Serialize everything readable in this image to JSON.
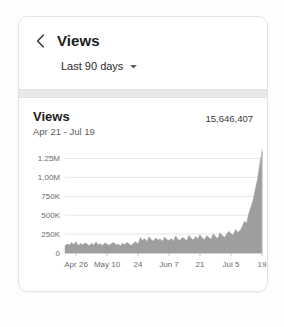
{
  "header": {
    "back_icon": "chevron-left-icon",
    "title": "Views",
    "range_label": "Last 90 days",
    "range_caret_icon": "chevron-down-icon"
  },
  "chart_card": {
    "title": "Views",
    "subtitle": "Apr 21 - Jul 19",
    "total": "15,646,407"
  },
  "colors": {
    "area_fill": "#9e9e9e",
    "gridline": "#e6e6e6",
    "axis_text": "#6b6b6b",
    "title_text": "#1d1d1d",
    "card_border": "#e4e4e4",
    "divider": "#e9e9e9"
  },
  "chart_data": {
    "type": "area",
    "title": "Views",
    "subtitle": "Apr 21 - Jul 19",
    "total": "15,646,407",
    "xlabel": "",
    "ylabel": "",
    "grid": true,
    "legend": "none",
    "ylim": [
      0,
      1375000
    ],
    "ytick_labels": [
      "1.25M",
      "1,00M",
      "750K",
      "500K",
      "250K",
      "0"
    ],
    "ytick_values": [
      1250000,
      1000000,
      750000,
      500000,
      250000,
      0
    ],
    "xtick_labels": [
      "Apr 26",
      "May 10",
      "24",
      "Jun 7",
      "21",
      "Jul 5",
      "19"
    ],
    "xtick_indices": [
      5,
      19,
      33,
      47,
      61,
      75,
      89
    ],
    "x_start": "Apr 21",
    "x_end": "Jul 19",
    "x": [
      "Apr 21",
      "Apr 22",
      "Apr 23",
      "Apr 24",
      "Apr 25",
      "Apr 26",
      "Apr 27",
      "Apr 28",
      "Apr 29",
      "Apr 30",
      "May 1",
      "May 2",
      "May 3",
      "May 4",
      "May 5",
      "May 6",
      "May 7",
      "May 8",
      "May 9",
      "May 10",
      "May 11",
      "May 12",
      "May 13",
      "May 14",
      "May 15",
      "May 16",
      "May 17",
      "May 18",
      "May 19",
      "May 20",
      "May 21",
      "May 22",
      "May 23",
      "May 24",
      "May 25",
      "May 26",
      "May 27",
      "May 28",
      "May 29",
      "May 30",
      "May 31",
      "Jun 1",
      "Jun 2",
      "Jun 3",
      "Jun 4",
      "Jun 5",
      "Jun 6",
      "Jun 7",
      "Jun 8",
      "Jun 9",
      "Jun 10",
      "Jun 11",
      "Jun 12",
      "Jun 13",
      "Jun 14",
      "Jun 15",
      "Jun 16",
      "Jun 17",
      "Jun 18",
      "Jun 19",
      "Jun 20",
      "Jun 21",
      "Jun 22",
      "Jun 23",
      "Jun 24",
      "Jun 25",
      "Jun 26",
      "Jun 27",
      "Jun 28",
      "Jun 29",
      "Jun 30",
      "Jul 1",
      "Jul 2",
      "Jul 3",
      "Jul 4",
      "Jul 5",
      "Jul 6",
      "Jul 7",
      "Jul 8",
      "Jul 9",
      "Jul 10",
      "Jul 11",
      "Jul 12",
      "Jul 13",
      "Jul 14",
      "Jul 15",
      "Jul 16",
      "Jul 17",
      "Jul 18",
      "Jul 19"
    ],
    "values": [
      95000,
      120000,
      105000,
      140000,
      112000,
      150000,
      98000,
      125000,
      108000,
      132000,
      118000,
      96000,
      128000,
      104000,
      145000,
      110000,
      122000,
      99000,
      134000,
      115000,
      101000,
      126000,
      138000,
      109000,
      117000,
      97000,
      130000,
      112000,
      142000,
      120000,
      100000,
      133000,
      148000,
      118000,
      205000,
      168000,
      190000,
      152000,
      215000,
      175000,
      160000,
      198000,
      172000,
      185000,
      156000,
      210000,
      178000,
      165000,
      192000,
      158000,
      225000,
      180000,
      168000,
      205000,
      188000,
      162000,
      235000,
      195000,
      172000,
      218000,
      185000,
      242000,
      198000,
      176000,
      228000,
      205000,
      182000,
      255000,
      215000,
      192000,
      268000,
      232000,
      205000,
      248000,
      288000,
      258000,
      235000,
      310000,
      275000,
      295000,
      345000,
      420000,
      390000,
      520000,
      610000,
      700000,
      845000,
      980000,
      1180000,
      1335000
    ]
  }
}
